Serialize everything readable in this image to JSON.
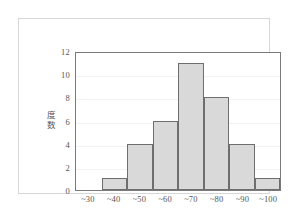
{
  "chart_data": {
    "type": "bar",
    "title": "",
    "subtitle": "",
    "xlabel": "",
    "ylabel": "度数",
    "ylabel_chars": [
      "度",
      "数"
    ],
    "categories": [
      "~30",
      "~40",
      "~50",
      "~60",
      "~70",
      "~80",
      "~90",
      "~100"
    ],
    "values": [
      0,
      1,
      4,
      6,
      11,
      8,
      4,
      1
    ],
    "ylim": [
      0,
      12
    ],
    "yticks": [
      0,
      2,
      4,
      6,
      8,
      10,
      12
    ],
    "ytick_labels": [
      "0",
      "2",
      "4",
      "6",
      "8",
      "10",
      "12"
    ],
    "grid": true,
    "grid_axis": "y",
    "legend": false,
    "legend_position": "none",
    "bar_fill_color": "#d9d9d9",
    "bar_border_color": "#6e6e6e",
    "axis_color": "#7a7a7a",
    "grid_color": "#f2f2f2",
    "frame_color": "#d6d6d6",
    "text_color": "#555555",
    "background_color": "#ffffff"
  }
}
